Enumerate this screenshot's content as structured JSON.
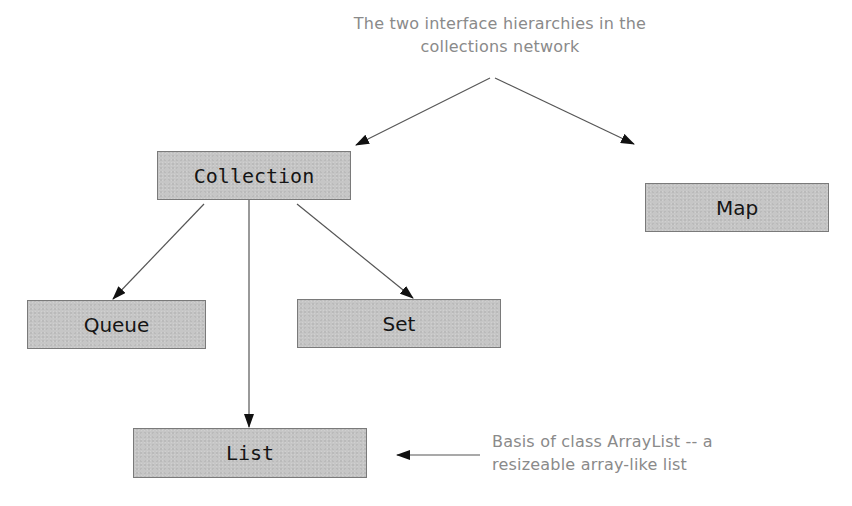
{
  "diagram": {
    "annotations": {
      "top": {
        "line1": "The two interface hierarchies in the",
        "line2": "collections network"
      },
      "bottom": {
        "line1": "Basis of class ArrayList -- a",
        "line2": "resizeable array-like list"
      }
    },
    "nodes": [
      {
        "id": "collection",
        "label": "Collection"
      },
      {
        "id": "map",
        "label": "Map"
      },
      {
        "id": "queue",
        "label": "Queue"
      },
      {
        "id": "set",
        "label": "Set"
      },
      {
        "id": "list",
        "label": "List"
      }
    ],
    "edges": [
      {
        "from": "annotation-top",
        "to": "collection"
      },
      {
        "from": "annotation-top",
        "to": "map"
      },
      {
        "from": "collection",
        "to": "queue"
      },
      {
        "from": "collection",
        "to": "list"
      },
      {
        "from": "collection",
        "to": "set"
      },
      {
        "from": "annotation-bottom",
        "to": "list"
      }
    ],
    "colors": {
      "node_fill": "#c6c6c6",
      "node_border": "#7a7a7a",
      "annotation_text": "#8a8a8a",
      "edge": "#555555"
    }
  }
}
